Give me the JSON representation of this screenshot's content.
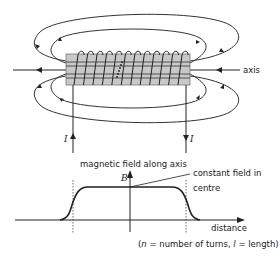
{
  "diagram": {
    "labels": {
      "axis": "axis",
      "current_left": "I",
      "current_right": "I",
      "graph_title": "magnetic field along axis",
      "y_axis": "B",
      "x_axis": "distance",
      "annotation_line1": "constant field in",
      "annotation_line2": "centre",
      "footnote_open": "(",
      "footnote_n": "n",
      "footnote_mid": " = number of turns, ",
      "footnote_l": "l",
      "footnote_end": " = length)"
    },
    "colors": {
      "line": "#222222",
      "core_fill": "#c8c8c8",
      "core_stroke": "#777777"
    },
    "coil_turns": 12
  }
}
